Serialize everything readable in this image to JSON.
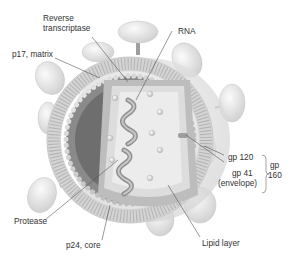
{
  "diagram": {
    "labels": {
      "reverse_transcriptase_line1": "Reverse",
      "reverse_transcriptase_line2": "transcriptase",
      "rna": "RNA",
      "p17_matrix": "p17, matrix",
      "gp120": "gp 120",
      "gp41": "gp 41",
      "envelope": "(envelope)",
      "gp160_line1": "gp",
      "gp160_line2": "160",
      "protease": "Protease",
      "p24_core": "p24, core",
      "lipid_layer": "Lipid layer"
    },
    "colors": {
      "background": "#ffffff",
      "spike_knob": "#e2e2e2",
      "lipid_layer": "#d9d9d9",
      "matrix_ring": "#7d7d7d",
      "core_fill": "#d4d4d4",
      "core_inner": "#ececec",
      "rna_strand": "#9a9a9a",
      "label_text": "#333333",
      "leader_line": "#555555"
    }
  }
}
